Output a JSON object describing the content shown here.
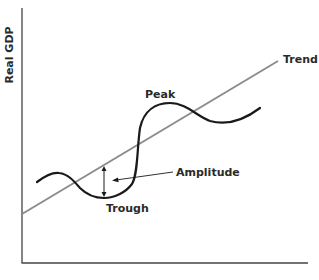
{
  "diagram": {
    "title": "",
    "y_axis_label": "Real GDP",
    "x_axis_label": "",
    "labels": {
      "trend": "Trend",
      "peak": "Peak",
      "trough": "Trough",
      "amplitude": "Amplitude"
    },
    "colors": {
      "axis": "#444444",
      "trend_line": "#8c8c8c",
      "cycle_curve": "#1a1a1a",
      "text": "#2a2a2a"
    }
  }
}
